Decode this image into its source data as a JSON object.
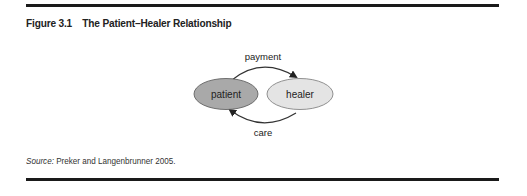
{
  "figure": {
    "number": "Figure 3.1",
    "title": "The Patient–Healer Relationship"
  },
  "diagram": {
    "nodes": [
      {
        "id": "patient",
        "label": "patient",
        "fill": "#a9a9a9"
      },
      {
        "id": "healer",
        "label": "healer",
        "fill": "#e4e4e4"
      }
    ],
    "edges": [
      {
        "from": "patient",
        "to": "healer",
        "label": "payment"
      },
      {
        "from": "healer",
        "to": "patient",
        "label": "care"
      }
    ]
  },
  "source": {
    "label": "Source:",
    "text": " Preker and Langenbrunner 2005."
  }
}
